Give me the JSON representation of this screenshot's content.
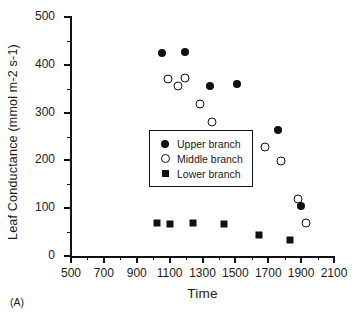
{
  "panel": {
    "label": "(A)"
  },
  "chart_data": {
    "type": "scatter",
    "title": "",
    "xlabel": "Time",
    "ylabel": "Leaf Conductance (mmol m-2 s-1)",
    "xlim": [
      500,
      2100
    ],
    "ylim": [
      0,
      500
    ],
    "grid": false,
    "legend_position": "inside-left",
    "x_ticks_major": [
      500,
      700,
      900,
      1100,
      1300,
      1500,
      1700,
      1900,
      2100
    ],
    "x_tick_labels": [
      "500",
      "700",
      "900",
      "1100",
      "1300",
      "1500",
      "1700",
      "1900",
      "2100"
    ],
    "x_ticks_minor": [
      600,
      800,
      1000,
      1200,
      1400,
      1600,
      1800,
      2000
    ],
    "y_ticks_major": [
      0,
      100,
      200,
      300,
      400,
      500
    ],
    "y_tick_labels": [
      "0",
      "100",
      "200",
      "300",
      "400",
      "500"
    ],
    "y_ticks_minor": [
      50,
      150,
      250,
      350,
      450
    ],
    "series": [
      {
        "name": "Upper branch",
        "marker": "filled-circle",
        "color": "#111111",
        "points": [
          {
            "x": 1055,
            "y": 425
          },
          {
            "x": 1195,
            "y": 427
          },
          {
            "x": 1345,
            "y": 355
          },
          {
            "x": 1510,
            "y": 360
          },
          {
            "x": 1760,
            "y": 263
          },
          {
            "x": 1900,
            "y": 105
          }
        ]
      },
      {
        "name": "Middle branch",
        "marker": "open-circle",
        "color": "#111111",
        "points": [
          {
            "x": 1090,
            "y": 370
          },
          {
            "x": 1150,
            "y": 355
          },
          {
            "x": 1195,
            "y": 372
          },
          {
            "x": 1285,
            "y": 318
          },
          {
            "x": 1355,
            "y": 280
          },
          {
            "x": 1480,
            "y": 245
          },
          {
            "x": 1680,
            "y": 228
          },
          {
            "x": 1780,
            "y": 199
          },
          {
            "x": 1880,
            "y": 119
          },
          {
            "x": 1930,
            "y": 68
          }
        ]
      },
      {
        "name": "Lower branch",
        "marker": "filled-square",
        "color": "#111111",
        "points": [
          {
            "x": 1025,
            "y": 70
          },
          {
            "x": 1100,
            "y": 67
          },
          {
            "x": 1240,
            "y": 68
          },
          {
            "x": 1430,
            "y": 67
          },
          {
            "x": 1645,
            "y": 43
          },
          {
            "x": 1830,
            "y": 33
          }
        ]
      }
    ]
  },
  "legend": {
    "entries": [
      {
        "label": "Upper branch",
        "marker": "filled-circle"
      },
      {
        "label": "Middle branch",
        "marker": "open-circle"
      },
      {
        "label": "Lower branch",
        "marker": "filled-square"
      }
    ]
  }
}
